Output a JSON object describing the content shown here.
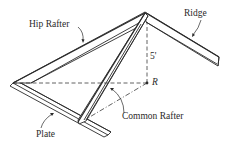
{
  "diagram": {
    "type": "isometric roof framing sketch",
    "labels": {
      "hip_rafter": "Hip Rafter",
      "ridge": "Ridge",
      "height": "5'",
      "point_r": "R",
      "common_rafter": "Common Rafter",
      "plate": "Plate"
    },
    "colors": {
      "stroke": "#2a2a2a",
      "fill": "#ffffff",
      "dash": "#3a3a3a"
    }
  }
}
